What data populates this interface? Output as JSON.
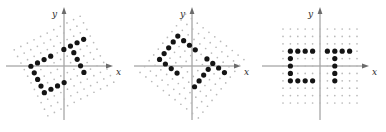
{
  "figure": {
    "background_color": "#ffffff",
    "dot_color": "#141414",
    "lattice_color": "#b9b9b9",
    "axis_color": "#8c8c8c",
    "panel_count": 3
  },
  "chart_data": {
    "type": "scatter",
    "xlabel": "x",
    "ylabel": "y",
    "grid": true,
    "legend": "none",
    "panels": [
      {
        "name": "panel-rotated-left",
        "label_x": "x",
        "label_y": "y",
        "rotation_deg": 27,
        "origin": [
          64,
          66
        ],
        "lattice_spacing": 7.4,
        "lattice_range": [
          -5,
          5
        ],
        "xlim": [
          -5,
          5
        ],
        "ylim": [
          -5,
          5
        ],
        "shapes": [
          {
            "glyph": "C",
            "points": [
              [
                -4,
                2
              ],
              [
                -4,
                1
              ],
              [
                -4,
                0
              ],
              [
                -4,
                -1
              ],
              [
                -4,
                -2
              ],
              [
                -3,
                2
              ],
              [
                -2,
                2
              ],
              [
                -1,
                2
              ],
              [
                -3,
                -2
              ],
              [
                -2,
                -2
              ],
              [
                -1,
                -2
              ]
            ]
          },
          {
            "glyph": "T",
            "points": [
              [
                1,
                2
              ],
              [
                2,
                2
              ],
              [
                3,
                2
              ],
              [
                4,
                2
              ],
              [
                2,
                1
              ],
              [
                2,
                0
              ],
              [
                2,
                -1
              ],
              [
                2,
                -2
              ]
            ]
          }
        ]
      },
      {
        "name": "panel-rotated-middle",
        "label_x": "x",
        "label_y": "y",
        "rotation_deg": -38,
        "origin": [
          64,
          66
        ],
        "lattice_spacing": 7.4,
        "lattice_range": [
          -5,
          5
        ],
        "xlim": [
          -5,
          5
        ],
        "ylim": [
          -5,
          5
        ],
        "shapes": [
          {
            "glyph": "C",
            "points": [
              [
                -4,
                2
              ],
              [
                -4,
                1
              ],
              [
                -4,
                0
              ],
              [
                -4,
                -1
              ],
              [
                -4,
                -2
              ],
              [
                -3,
                2
              ],
              [
                -2,
                2
              ],
              [
                -1,
                2
              ],
              [
                -3,
                -2
              ],
              [
                -2,
                -2
              ],
              [
                -1,
                -2
              ]
            ]
          },
          {
            "glyph": "T",
            "points": [
              [
                1,
                2
              ],
              [
                2,
                2
              ],
              [
                3,
                2
              ],
              [
                4,
                2
              ],
              [
                2,
                1
              ],
              [
                2,
                0
              ],
              [
                2,
                -1
              ],
              [
                2,
                -2
              ]
            ]
          }
        ]
      },
      {
        "name": "panel-axis-aligned",
        "label_x": "x",
        "label_y": "y",
        "rotation_deg": 0,
        "origin": [
          64,
          66
        ],
        "lattice_spacing": 7.4,
        "lattice_range": [
          -5,
          5
        ],
        "xlim": [
          -5,
          5
        ],
        "ylim": [
          -5,
          5
        ],
        "shapes": [
          {
            "glyph": "C",
            "points": [
              [
                -4,
                2
              ],
              [
                -4,
                1
              ],
              [
                -4,
                0
              ],
              [
                -4,
                -1
              ],
              [
                -4,
                -2
              ],
              [
                -3,
                2
              ],
              [
                -2,
                2
              ],
              [
                -1,
                2
              ],
              [
                -3,
                -2
              ],
              [
                -2,
                -2
              ],
              [
                -1,
                -2
              ]
            ]
          },
          {
            "glyph": "T",
            "points": [
              [
                1,
                2
              ],
              [
                2,
                2
              ],
              [
                3,
                2
              ],
              [
                4,
                2
              ],
              [
                2,
                1
              ],
              [
                2,
                0
              ],
              [
                2,
                -1
              ],
              [
                2,
                -2
              ]
            ]
          }
        ]
      }
    ]
  }
}
